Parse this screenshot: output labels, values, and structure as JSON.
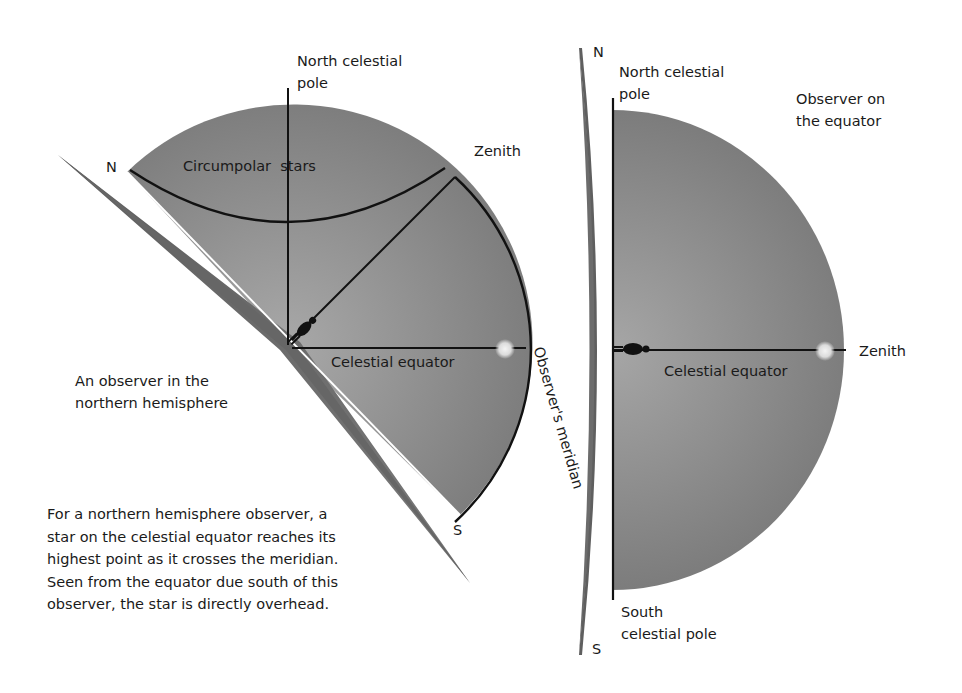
{
  "left_diagram": {
    "title": "An observer in the northern hemisphere",
    "labels": {
      "north_celestial_pole": [
        "North celestial",
        "pole"
      ],
      "zenith": "Zenith",
      "north": "N",
      "south": "S",
      "circumpolar_stars": "Circumpolar  stars",
      "celestial_equator": "Celestial equator",
      "observers_meridian": "Observer's meridian",
      "caption": [
        "An observer in the",
        "northern hemisphere"
      ]
    },
    "description": "For a northern hemisphere observer, a star on the celestial equator reaches its highest point as it crosses the meridian. Seen from the equator due south of this observer, the star is directly overhead."
  },
  "right_diagram": {
    "title": "Observer on the equator",
    "labels": {
      "north": "N",
      "south": "S",
      "north_celestial_pole": [
        "North celestial",
        "pole"
      ],
      "south_celestial_pole": [
        "South",
        "celestial pole"
      ],
      "zenith": "Zenith",
      "celestial_equator": "Celestial equator",
      "caption": [
        "Observer on",
        "the equator"
      ]
    }
  },
  "colors": {
    "dome": "#8a8a8a",
    "dome_light": "#a3a3a3",
    "horizon_slab": "#6e6e6e",
    "line": "#111111",
    "star": "#e8e8e8",
    "text": "#1a1a1a"
  }
}
